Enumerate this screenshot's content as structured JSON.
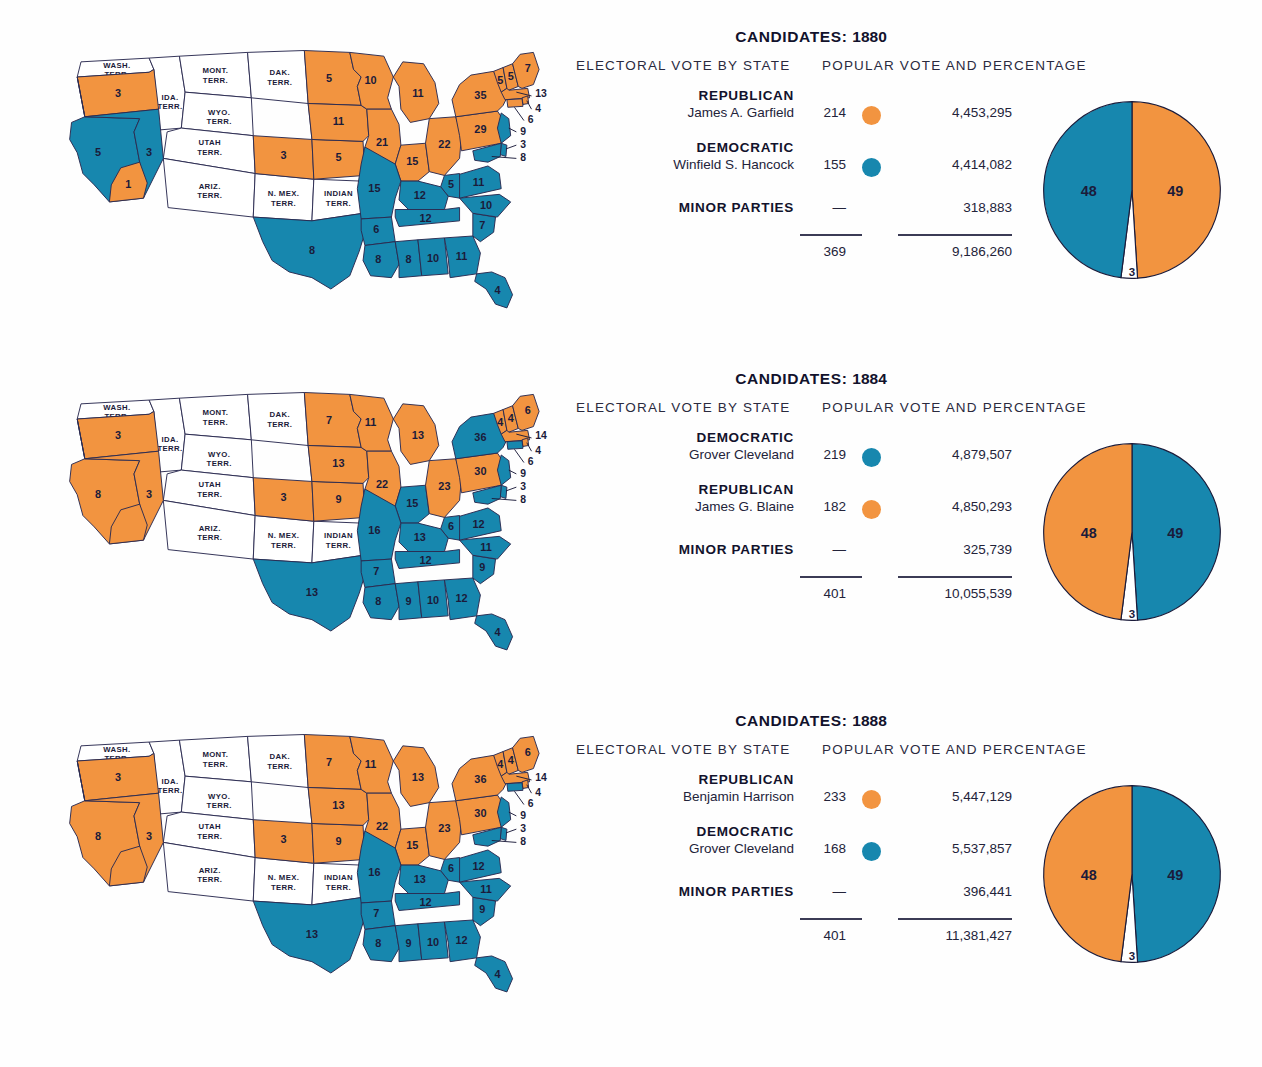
{
  "colors": {
    "republican_orange": "#F29440",
    "democratic_teal": "#1787AE",
    "territory_white": "#FFFFFF",
    "outline": "#2A2A50",
    "text": "#1B1B3A"
  },
  "labels": {
    "electoral_header": "ELECTORAL VOTE BY STATE",
    "popular_header": "POPULAR VOTE AND PERCENTAGE",
    "candidates_prefix": "CANDIDATES:",
    "minor_parties": "MINOR PARTIES",
    "dash": "—"
  },
  "territories": [
    {
      "id": "wash",
      "lines": [
        "WASH.",
        "TERR."
      ]
    },
    {
      "id": "ida",
      "lines": [
        "IDA.",
        "TERR."
      ]
    },
    {
      "id": "mont",
      "lines": [
        "MONT.",
        "TERR."
      ]
    },
    {
      "id": "wyo",
      "lines": [
        "WYO.",
        "TERR."
      ]
    },
    {
      "id": "dak",
      "lines": [
        "DAK.",
        "TERR."
      ]
    },
    {
      "id": "utah",
      "lines": [
        "UTAH",
        "TERR."
      ]
    },
    {
      "id": "ariz",
      "lines": [
        "ARIZ.",
        "TERR."
      ]
    },
    {
      "id": "nmex",
      "lines": [
        "N. MEX.",
        "TERR."
      ]
    },
    {
      "id": "indian",
      "lines": [
        "INDIAN",
        "TERR."
      ]
    }
  ],
  "panels": [
    {
      "year": "1880",
      "title": "CANDIDATES: 1880",
      "parties": [
        {
          "party": "REPUBLICAN",
          "name": "James A. Garfield",
          "electoral": "214",
          "popular": "4,453,295",
          "color": "#F29440"
        },
        {
          "party": "DEMOCRATIC",
          "name": "Winfield S. Hancock",
          "electoral": "155",
          "popular": "4,414,082",
          "color": "#1787AE"
        },
        {
          "party": "MINOR PARTIES",
          "name": "",
          "electoral": "—",
          "popular": "318,883",
          "color": ""
        }
      ],
      "total_electoral": "369",
      "total_popular": "9,186,260",
      "pie": {
        "left_pct": "48",
        "left_color": "#1787AE",
        "right_pct": "49",
        "right_color": "#F29440",
        "minor_pct": "3",
        "minor_color": "#FFFFFF"
      },
      "states": {
        "or": {
          "v": "3",
          "c": "r"
        },
        "ca": {
          "v": "5",
          "c": "d"
        },
        "ca_south": {
          "v": "1",
          "c": "r"
        },
        "nv": {
          "v": "3",
          "c": "d"
        },
        "co": {
          "v": "3",
          "c": "r"
        },
        "ne": {
          "v": "3",
          "c": "r"
        },
        "ks": {
          "v": "5",
          "c": "r"
        },
        "tx": {
          "v": "8",
          "c": "d"
        },
        "mn": {
          "v": "5",
          "c": "r"
        },
        "ia": {
          "v": "11",
          "c": "r"
        },
        "wi": {
          "v": "10",
          "c": "r"
        },
        "mi": {
          "v": "11",
          "c": "r"
        },
        "il": {
          "v": "21",
          "c": "r"
        },
        "in": {
          "v": "15",
          "c": "r"
        },
        "oh": {
          "v": "22",
          "c": "r"
        },
        "pa": {
          "v": "29",
          "c": "r"
        },
        "ny": {
          "v": "35",
          "c": "r"
        },
        "vt": {
          "v": "5",
          "c": "r"
        },
        "nh": {
          "v": "5",
          "c": "r"
        },
        "me": {
          "v": "7",
          "c": "r"
        },
        "ma": {
          "v": "13",
          "c": "r"
        },
        "ri": {
          "v": "4",
          "c": "r"
        },
        "ct": {
          "v": "6",
          "c": "r"
        },
        "nj": {
          "v": "9",
          "c": "d"
        },
        "de": {
          "v": "3",
          "c": "d"
        },
        "md": {
          "v": "8",
          "c": "d"
        },
        "mo": {
          "v": "15",
          "c": "d"
        },
        "ar": {
          "v": "6",
          "c": "d"
        },
        "la": {
          "v": "8",
          "c": "d"
        },
        "ms": {
          "v": "8",
          "c": "d"
        },
        "al": {
          "v": "10",
          "c": "d"
        },
        "ga": {
          "v": "11",
          "c": "d"
        },
        "fl": {
          "v": "4",
          "c": "d"
        },
        "sc": {
          "v": "7",
          "c": "d"
        },
        "nc": {
          "v": "10",
          "c": "d"
        },
        "va": {
          "v": "11",
          "c": "d"
        },
        "wv": {
          "v": "5",
          "c": "d"
        },
        "ky": {
          "v": "12",
          "c": "d"
        },
        "tn": {
          "v": "12",
          "c": "d"
        }
      }
    },
    {
      "year": "1884",
      "title": "CANDIDATES: 1884",
      "parties": [
        {
          "party": "DEMOCRATIC",
          "name": "Grover Cleveland",
          "electoral": "219",
          "popular": "4,879,507",
          "color": "#1787AE"
        },
        {
          "party": "REPUBLICAN",
          "name": "James G. Blaine",
          "electoral": "182",
          "popular": "4,850,293",
          "color": "#F29440"
        },
        {
          "party": "MINOR PARTIES",
          "name": "",
          "electoral": "—",
          "popular": "325,739",
          "color": ""
        }
      ],
      "total_electoral": "401",
      "total_popular": "10,055,539",
      "pie": {
        "left_pct": "48",
        "left_color": "#F29440",
        "right_pct": "49",
        "right_color": "#1787AE",
        "minor_pct": "3",
        "minor_color": "#FFFFFF"
      },
      "states": {
        "or": {
          "v": "3",
          "c": "r"
        },
        "ca": {
          "v": "8",
          "c": "r"
        },
        "ca_south": {
          "v": "",
          "c": "r"
        },
        "nv": {
          "v": "3",
          "c": "r"
        },
        "co": {
          "v": "3",
          "c": "r"
        },
        "ne": {
          "v": "5",
          "c": "r"
        },
        "ks": {
          "v": "9",
          "c": "r"
        },
        "tx": {
          "v": "13",
          "c": "d"
        },
        "mn": {
          "v": "7",
          "c": "r"
        },
        "ia": {
          "v": "13",
          "c": "r"
        },
        "wi": {
          "v": "11",
          "c": "r"
        },
        "mi": {
          "v": "13",
          "c": "r"
        },
        "il": {
          "v": "22",
          "c": "r"
        },
        "in": {
          "v": "15",
          "c": "d"
        },
        "oh": {
          "v": "23",
          "c": "r"
        },
        "pa": {
          "v": "30",
          "c": "r"
        },
        "ny": {
          "v": "36",
          "c": "d"
        },
        "vt": {
          "v": "4",
          "c": "r"
        },
        "nh": {
          "v": "4",
          "c": "r"
        },
        "me": {
          "v": "6",
          "c": "r"
        },
        "ma": {
          "v": "14",
          "c": "r"
        },
        "ri": {
          "v": "4",
          "c": "r"
        },
        "ct": {
          "v": "6",
          "c": "d"
        },
        "nj": {
          "v": "9",
          "c": "d"
        },
        "de": {
          "v": "3",
          "c": "d"
        },
        "md": {
          "v": "8",
          "c": "d"
        },
        "mo": {
          "v": "16",
          "c": "d"
        },
        "ar": {
          "v": "7",
          "c": "d"
        },
        "la": {
          "v": "8",
          "c": "d"
        },
        "ms": {
          "v": "9",
          "c": "d"
        },
        "al": {
          "v": "10",
          "c": "d"
        },
        "ga": {
          "v": "12",
          "c": "d"
        },
        "fl": {
          "v": "4",
          "c": "d"
        },
        "sc": {
          "v": "9",
          "c": "d"
        },
        "nc": {
          "v": "11",
          "c": "d"
        },
        "va": {
          "v": "12",
          "c": "d"
        },
        "wv": {
          "v": "6",
          "c": "d"
        },
        "ky": {
          "v": "13",
          "c": "d"
        },
        "tn": {
          "v": "12",
          "c": "d"
        }
      }
    },
    {
      "year": "1888",
      "title": "CANDIDATES: 1888",
      "parties": [
        {
          "party": "REPUBLICAN",
          "name": "Benjamin Harrison",
          "electoral": "233",
          "popular": "5,447,129",
          "color": "#F29440"
        },
        {
          "party": "DEMOCRATIC",
          "name": "Grover Cleveland",
          "electoral": "168",
          "popular": "5,537,857",
          "color": "#1787AE"
        },
        {
          "party": "MINOR PARTIES",
          "name": "",
          "electoral": "—",
          "popular": "396,441",
          "color": ""
        }
      ],
      "total_electoral": "401",
      "total_popular": "11,381,427",
      "pie": {
        "left_pct": "48",
        "left_color": "#F29440",
        "right_pct": "49",
        "right_color": "#1787AE",
        "minor_pct": "3",
        "minor_color": "#FFFFFF"
      },
      "states": {
        "or": {
          "v": "3",
          "c": "r"
        },
        "ca": {
          "v": "8",
          "c": "r"
        },
        "ca_south": {
          "v": "",
          "c": "r"
        },
        "nv": {
          "v": "3",
          "c": "r"
        },
        "co": {
          "v": "3",
          "c": "r"
        },
        "ne": {
          "v": "5",
          "c": "r"
        },
        "ks": {
          "v": "9",
          "c": "r"
        },
        "tx": {
          "v": "13",
          "c": "d"
        },
        "mn": {
          "v": "7",
          "c": "r"
        },
        "ia": {
          "v": "13",
          "c": "r"
        },
        "wi": {
          "v": "11",
          "c": "r"
        },
        "mi": {
          "v": "13",
          "c": "r"
        },
        "il": {
          "v": "22",
          "c": "r"
        },
        "in": {
          "v": "15",
          "c": "r"
        },
        "oh": {
          "v": "23",
          "c": "r"
        },
        "pa": {
          "v": "30",
          "c": "r"
        },
        "ny": {
          "v": "36",
          "c": "r"
        },
        "vt": {
          "v": "4",
          "c": "r"
        },
        "nh": {
          "v": "4",
          "c": "r"
        },
        "me": {
          "v": "6",
          "c": "r"
        },
        "ma": {
          "v": "14",
          "c": "r"
        },
        "ri": {
          "v": "4",
          "c": "r"
        },
        "ct": {
          "v": "6",
          "c": "d"
        },
        "nj": {
          "v": "9",
          "c": "d"
        },
        "de": {
          "v": "3",
          "c": "d"
        },
        "md": {
          "v": "8",
          "c": "d"
        },
        "mo": {
          "v": "16",
          "c": "d"
        },
        "ar": {
          "v": "7",
          "c": "d"
        },
        "la": {
          "v": "8",
          "c": "d"
        },
        "ms": {
          "v": "9",
          "c": "d"
        },
        "al": {
          "v": "10",
          "c": "d"
        },
        "ga": {
          "v": "12",
          "c": "d"
        },
        "fl": {
          "v": "4",
          "c": "d"
        },
        "sc": {
          "v": "9",
          "c": "d"
        },
        "nc": {
          "v": "11",
          "c": "d"
        },
        "va": {
          "v": "12",
          "c": "d"
        },
        "wv": {
          "v": "6",
          "c": "d"
        },
        "ky": {
          "v": "13",
          "c": "d"
        },
        "tn": {
          "v": "12",
          "c": "d"
        }
      }
    }
  ],
  "chart_data": [
    {
      "type": "pie",
      "title": "Popular vote percentage 1880",
      "categories": [
        "Republican (Garfield)",
        "Democratic (Hancock)",
        "Minor parties"
      ],
      "values": [
        49,
        48,
        3
      ],
      "colors": [
        "#F29440",
        "#1787AE",
        "#FFFFFF"
      ],
      "legend": "none"
    },
    {
      "type": "pie",
      "title": "Popular vote percentage 1884",
      "categories": [
        "Democratic (Cleveland)",
        "Republican (Blaine)",
        "Minor parties"
      ],
      "values": [
        49,
        48,
        3
      ],
      "colors": [
        "#1787AE",
        "#F29440",
        "#FFFFFF"
      ],
      "legend": "none"
    },
    {
      "type": "pie",
      "title": "Popular vote percentage 1888",
      "categories": [
        "Democratic (Cleveland)",
        "Republican (Harrison)",
        "Minor parties"
      ],
      "values": [
        49,
        48,
        3
      ],
      "colors": [
        "#1787AE",
        "#F29440",
        "#FFFFFF"
      ],
      "legend": "none"
    }
  ]
}
